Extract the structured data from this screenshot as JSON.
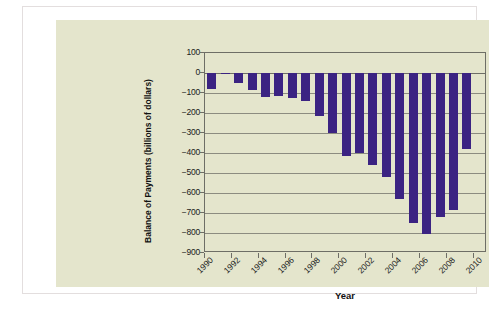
{
  "chart_data": {
    "type": "bar",
    "title": "",
    "xlabel": "Year",
    "ylabel": "Balance of Payments (billions of dollars)",
    "ylim": [
      -900,
      100
    ],
    "ytick_labels": [
      "100",
      "0",
      "−100",
      "−200",
      "−300",
      "−400",
      "−500",
      "−600",
      "−700",
      "−800",
      "−900"
    ],
    "ytick_values": [
      100,
      0,
      -100,
      -200,
      -300,
      -400,
      -500,
      -600,
      -700,
      -800,
      -900
    ],
    "xtick_labels": [
      "1990",
      "1992",
      "1994",
      "1996",
      "1998",
      "2000",
      "2002",
      "2004",
      "2006",
      "2008",
      "2010"
    ],
    "xtick_values": [
      1990,
      1992,
      1994,
      1996,
      1998,
      2000,
      2002,
      2004,
      2006,
      2008,
      2010
    ],
    "grid": true,
    "legend": "none",
    "bar_color": "#3b2382",
    "plot_background": "#e4e5cc",
    "categories": [
      1990,
      1991,
      1992,
      1993,
      1994,
      1995,
      1996,
      1997,
      1998,
      1999,
      2000,
      2001,
      2002,
      2003,
      2004,
      2005,
      2006,
      2007,
      2008,
      2009
    ],
    "values": [
      -79,
      -3,
      -50,
      -85,
      -122,
      -114,
      -125,
      -141,
      -215,
      -302,
      -417,
      -398,
      -459,
      -522,
      -632,
      -749,
      -804,
      -718,
      -687,
      -378
    ],
    "series": [
      {
        "name": "Balance of Payments",
        "values": [
          -79,
          -3,
          -50,
          -85,
          -122,
          -114,
          -125,
          -141,
          -215,
          -302,
          -417,
          -398,
          -459,
          -522,
          -632,
          -749,
          -804,
          -718,
          -687,
          -378
        ]
      }
    ]
  }
}
